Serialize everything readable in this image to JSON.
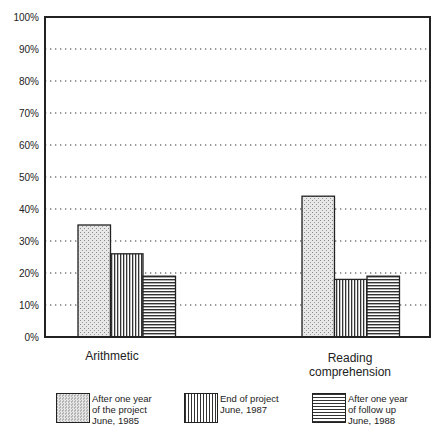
{
  "chart_data": {
    "type": "bar",
    "title": "",
    "xlabel": "",
    "ylabel": "",
    "ylim": [
      0,
      100
    ],
    "yticks": [
      "0%",
      "10%",
      "20%",
      "30%",
      "40%",
      "50%",
      "60%",
      "70%",
      "80%",
      "90%",
      "100%"
    ],
    "grid": true,
    "categories": [
      "Arithmetic",
      "Reading comprehension"
    ],
    "series": [
      {
        "name": "After one year of the project June, 1985",
        "pattern": "stipple",
        "values": [
          35,
          44
        ]
      },
      {
        "name": "End of project June, 1987",
        "pattern": "vertical-lines",
        "values": [
          26,
          18
        ]
      },
      {
        "name": "After one year of follow up June, 1988",
        "pattern": "horizontal-lines",
        "values": [
          19,
          19
        ]
      }
    ],
    "legend_position": "bottom"
  },
  "labels": {
    "cat1": "Arithmetic",
    "cat2_line1": "Reading",
    "cat2_line2": "comprehension"
  },
  "legend": [
    {
      "lines": [
        "After one year",
        "of the project",
        "June, 1985"
      ]
    },
    {
      "lines": [
        "End of project",
        "June, 1987"
      ]
    },
    {
      "lines": [
        "After one year",
        "of follow up",
        "June, 1988"
      ]
    }
  ]
}
